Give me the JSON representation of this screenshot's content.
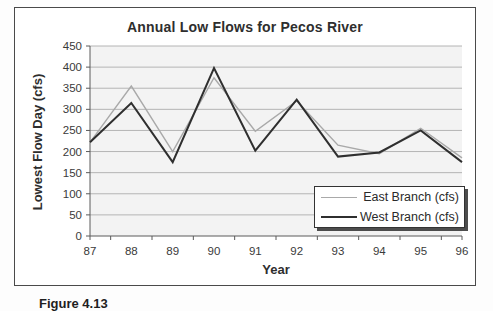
{
  "figure": {
    "caption": "Figure 4.13"
  },
  "chart_data": {
    "type": "line",
    "title": "Annual Low Flows for Pecos River",
    "xlabel": "Year",
    "ylabel": "Lowest Flow Day (cfs)",
    "categories": [
      "87",
      "88",
      "89",
      "90",
      "91",
      "92",
      "93",
      "94",
      "95",
      "96"
    ],
    "series": [
      {
        "name": "East Branch (cfs)",
        "color": "#a9a9a9",
        "stroke_width": 1.4,
        "values": [
          222,
          355,
          200,
          375,
          248,
          320,
          215,
          195,
          255,
          185
        ]
      },
      {
        "name": "West Branch (cfs)",
        "color": "#2f2f2f",
        "stroke_width": 2,
        "values": [
          222,
          315,
          175,
          398,
          202,
          323,
          188,
          198,
          250,
          175
        ]
      }
    ],
    "ylim": [
      0,
      450
    ],
    "ytick_step": 50,
    "grid": true,
    "legend_position": "bottom-right",
    "colors": {
      "plot_background": "#f3f3f3",
      "gridline": "#b4b4b4",
      "axis": "#5a5a5a",
      "tick_label": "#3a3a3a"
    }
  }
}
